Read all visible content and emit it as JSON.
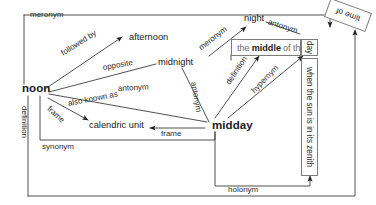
{
  "diagram": {
    "type": "semantic-network-graph",
    "style": "scanned black-and-white line drawing",
    "title_text": "",
    "nodes": [
      {
        "id": "noon",
        "label": "noon",
        "emphasis": "bold",
        "x": 22,
        "y": 88
      },
      {
        "id": "midday",
        "label": "midday",
        "emphasis": "bold",
        "x": 212,
        "y": 126
      },
      {
        "id": "afternoon",
        "label": "afternoon",
        "emphasis": "plain",
        "x": 129,
        "y": 38
      },
      {
        "id": "midnight",
        "label": "midnight",
        "emphasis": "plain",
        "x": 160,
        "y": 63
      },
      {
        "id": "night",
        "label": "night",
        "emphasis": "plain",
        "x": 245,
        "y": 19
      },
      {
        "id": "calendric_unit",
        "label": "calendric unit",
        "emphasis": "plain",
        "x": 90,
        "y": 125
      },
      {
        "id": "definition_box",
        "label": "the middle of the",
        "emphasis": "boxed-gray",
        "x": 231,
        "y": 40
      },
      {
        "id": "day_cell",
        "label": "day",
        "emphasis": "boxed-vertical",
        "x": 305,
        "y": 40
      },
      {
        "id": "zenith_box",
        "label": "when the sun is in its zenith",
        "emphasis": "boxed-vertical",
        "x": 305,
        "y": 60
      },
      {
        "id": "time_of_box",
        "label": "time of",
        "emphasis": "boxed-rotated",
        "x": 330,
        "y": 8
      }
    ],
    "definition_box": {
      "prefix": "the ",
      "bold": "middle",
      "suffix": " of the"
    },
    "edges": [
      {
        "id": "e-meronym-outer",
        "label": "meronym",
        "from": "frame-left",
        "to": "night"
      },
      {
        "id": "e-followed-by",
        "label": "followed by",
        "from": "noon",
        "to": "afternoon"
      },
      {
        "id": "e-opposite",
        "label": "opposite",
        "from": "noon",
        "to": "midnight"
      },
      {
        "id": "e-antonym-noon",
        "label": "antonym",
        "from": "noon",
        "to": "midnight"
      },
      {
        "id": "e-antonym-vert",
        "label": "antonym",
        "from": "midnight",
        "to": "midday"
      },
      {
        "id": "e-antonym-night",
        "label": "antonym",
        "from": "night",
        "to": "time-of"
      },
      {
        "id": "e-also-known-as",
        "label": "also known as",
        "from": "noon",
        "to": "midday"
      },
      {
        "id": "e-frame-left",
        "label": "frame",
        "from": "noon",
        "to": "calendric-unit"
      },
      {
        "id": "e-frame-right",
        "label": "frame",
        "from": "midday",
        "to": "calendric-unit"
      },
      {
        "id": "e-definition-left",
        "label": "definition",
        "from": "noon",
        "to": "definition-box"
      },
      {
        "id": "e-definition-mid",
        "label": "definition",
        "from": "midday",
        "to": "definition-box"
      },
      {
        "id": "e-synonym",
        "label": "synonym",
        "from": "noon",
        "to": "midday"
      },
      {
        "id": "e-hypernym",
        "label": "hypernym",
        "from": "midday",
        "to": "day"
      },
      {
        "id": "e-holonym",
        "label": "holonym",
        "from": "midday",
        "to": "zenith-box"
      },
      {
        "id": "e-meronym-night",
        "label": "meronym",
        "from": "midday",
        "to": "night"
      }
    ],
    "edge_labels": {
      "meronym_top_left": "meronym",
      "followed_by": "followed by",
      "opposite": "opposite",
      "antonym_noon": "antonym",
      "antonym_vertical": "antonym",
      "antonym_night": "antonym",
      "also_known_as": "also known as",
      "frame_left": "frame",
      "frame_right": "frame",
      "definition_left": "definition",
      "definition_mid": "definition",
      "synonym": "synonym",
      "hypernym": "hypernym",
      "holonym": "holonym",
      "meronym_night": "meronym"
    },
    "colors": {
      "ink": "#1a1a1a",
      "line": "#4a4a4a",
      "box_border": "#7d7d7d",
      "muted_text": "#6e6e6e",
      "background": "#ffffff"
    }
  }
}
